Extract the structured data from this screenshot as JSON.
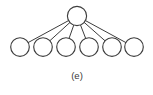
{
  "figure": {
    "caption": "(e)",
    "caption_x": 77,
    "caption_y": 76,
    "topology_name": "star-topology",
    "width": 153,
    "height": 95
  },
  "style": {
    "background": "#ffffff",
    "node_stroke": "#3d3d3d",
    "node_fill": "#ffffff",
    "node_stroke_width": 1.15,
    "edge_stroke": "#3d3d3d",
    "edge_stroke_width": 1.0,
    "caption_color": "#3a3a3a"
  },
  "chart_data": {
    "type": "diagram",
    "title": "",
    "subtype": "node-link-graph",
    "layout": "star",
    "node_radius": 9.3,
    "hub_radius": 9.6,
    "nodes": [
      {
        "id": "hub",
        "label": "",
        "role": "hub",
        "x": 77,
        "y": 16
      },
      {
        "id": "n1",
        "label": "",
        "role": "leaf",
        "x": 20,
        "y": 47
      },
      {
        "id": "n2",
        "label": "",
        "role": "leaf",
        "x": 43,
        "y": 47
      },
      {
        "id": "n3",
        "label": "",
        "role": "leaf",
        "x": 66,
        "y": 47
      },
      {
        "id": "n4",
        "label": "",
        "role": "leaf",
        "x": 89,
        "y": 47
      },
      {
        "id": "n5",
        "label": "",
        "role": "leaf",
        "x": 112,
        "y": 47
      },
      {
        "id": "n6",
        "label": "",
        "role": "leaf",
        "x": 134,
        "y": 47
      }
    ],
    "edges": [
      {
        "from": "hub",
        "to": "n1"
      },
      {
        "from": "hub",
        "to": "n2"
      },
      {
        "from": "hub",
        "to": "n3"
      },
      {
        "from": "hub",
        "to": "n4"
      },
      {
        "from": "hub",
        "to": "n5"
      },
      {
        "from": "hub",
        "to": "n6"
      }
    ],
    "node_count": 7,
    "leaf_count": 6,
    "edge_count": 6
  }
}
